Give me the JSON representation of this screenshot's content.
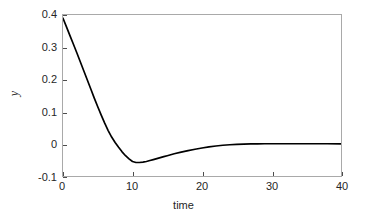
{
  "chart_data": {
    "type": "line",
    "title": "",
    "xlabel": "time",
    "ylabel": "y",
    "xlim": [
      0,
      40
    ],
    "ylim": [
      -0.1,
      0.4
    ],
    "xticks": [
      "0",
      "10",
      "20",
      "30",
      "40"
    ],
    "xtick_values": [
      0,
      10,
      20,
      30,
      40
    ],
    "yticks": [
      "0.4",
      "0.3",
      "0.2",
      "0.1",
      "0",
      "-0.1"
    ],
    "ytick_values": [
      0.4,
      0.3,
      0.2,
      0.1,
      0,
      -0.1
    ],
    "grid": false,
    "legend": null,
    "line_color": "#000000",
    "axes_color": "#a9a9a9",
    "background_color": "#ffffff",
    "series": [
      {
        "name": "y",
        "x": [
          0,
          0.5,
          1,
          1.5,
          2,
          2.5,
          3,
          3.5,
          4,
          4.5,
          5,
          5.5,
          6,
          6.5,
          7,
          7.5,
          8,
          8.5,
          9,
          9.5,
          10,
          10.5,
          11,
          11.5,
          12,
          12.5,
          13,
          13.5,
          14,
          14.5,
          15,
          16,
          17,
          18,
          19,
          20,
          21,
          22,
          23,
          24,
          25,
          26,
          27,
          28,
          29,
          30,
          32,
          34,
          36,
          38,
          40
        ],
        "values": [
          0.39,
          0.363,
          0.336,
          0.309,
          0.282,
          0.254,
          0.226,
          0.198,
          0.17,
          0.142,
          0.115,
          0.089,
          0.064,
          0.041,
          0.021,
          0.004,
          -0.011,
          -0.025,
          -0.037,
          -0.047,
          -0.055,
          -0.058,
          -0.058,
          -0.057,
          -0.055,
          -0.052,
          -0.049,
          -0.046,
          -0.043,
          -0.04,
          -0.037,
          -0.031,
          -0.026,
          -0.021,
          -0.017,
          -0.013,
          -0.0095,
          -0.0068,
          -0.0046,
          -0.0029,
          -0.0017,
          -0.0009,
          -0.0004,
          -0.0001,
          0.0001,
          0.0002,
          0.0002,
          0.0002,
          0.0001,
          0.0001,
          0.0
        ]
      }
    ]
  }
}
